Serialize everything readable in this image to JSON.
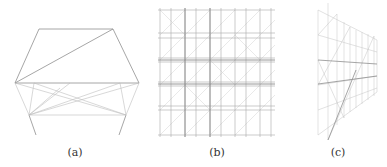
{
  "figure": {
    "panels": [
      {
        "id": "a",
        "caption": "(a)",
        "description": "single truss module with trapezoid top and cross-braced lower frame"
      },
      {
        "id": "b",
        "caption": "(b)",
        "description": "5x5 grid lattice of truss modules, front view"
      },
      {
        "id": "c",
        "caption": "(c)",
        "description": "lattice of truss modules, perspective side view"
      }
    ],
    "line_color": "#9a9a9a",
    "line_color_light": "#c8c8c8"
  }
}
